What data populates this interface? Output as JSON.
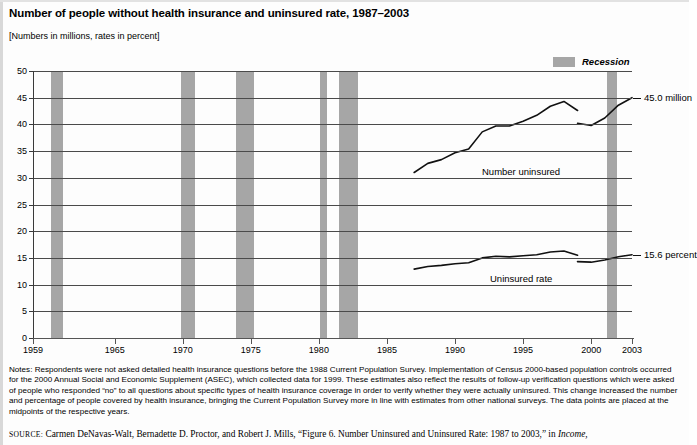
{
  "header": {
    "title": "Number of people without health insurance and uninsured rate, 1987–2003",
    "subtitle": "[Numbers in millions, rates in percent]"
  },
  "legend": {
    "recession_label": "Recession",
    "recession_color": "#a6a6a6"
  },
  "notes": {
    "text": "Notes: Respondents were not asked detailed health insurance questions before the 1988 Current Population Survey. Implementation of Census 2000-based population controls occurred for the 2000 Annual Social and Economic Supplement (ASEC), which collected data for 1999. These estimates also reflect the results of follow-up verification questions which were asked of people who responded “no” to all questions about specific types of health insurance coverage in order to verify whether they were actually uninsured. This change increased the number and percentage of people covered by health insurance, bringing the Current Population Survey more in line with estimates from other national surveys. The data points are placed at the midpoints of the respective years."
  },
  "source": {
    "prefix": "SOURCE:",
    "body": "Carmen DeNavas-Walt, Bernadette D. Proctor, and Robert J. Mills, “Figure 6. Number Uninsured and Uninsured Rate: 1987 to 2003,” in ",
    "italic_tail": "Income,"
  },
  "chart_data": {
    "type": "line",
    "title": "Number of people without health insurance and uninsured rate, 1987–2003",
    "subtitle": "[Numbers in millions, rates in percent]",
    "xlabel": "",
    "ylabel": "",
    "xlim": [
      1959,
      2003
    ],
    "ylim": [
      0,
      50
    ],
    "ytick_values": [
      0,
      5,
      10,
      15,
      20,
      25,
      30,
      35,
      40,
      45,
      50
    ],
    "ytick_labels": [
      "0",
      "5",
      "10",
      "15",
      "20",
      "25",
      "30",
      "35",
      "40",
      "45",
      "50"
    ],
    "xtick_values": [
      1959,
      1965,
      1970,
      1975,
      1980,
      1985,
      1990,
      1995,
      2000,
      2003
    ],
    "xtick_labels": [
      "1959",
      "1965",
      "1970",
      "1975",
      "1980",
      "1985",
      "1990",
      "1995",
      "2000",
      "2003"
    ],
    "grid": "horizontal",
    "legend_position": "top-right",
    "series": [
      {
        "name": "Number uninsured",
        "unit": "millions",
        "annotation": "Number uninsured",
        "end_label": "45.0 million",
        "end_value": 45.0,
        "x": [
          1987,
          1988,
          1989,
          1990,
          1991,
          1992,
          1993,
          1994,
          1995,
          1996,
          1997,
          1998,
          1999
        ],
        "values": [
          31.0,
          32.7,
          33.4,
          34.7,
          35.4,
          38.6,
          39.7,
          39.7,
          40.6,
          41.7,
          43.4,
          44.3,
          42.6
        ]
      },
      {
        "name": "Number uninsured (revised methodology)",
        "unit": "millions",
        "x": [
          1999,
          2000,
          2001,
          2002,
          2003
        ],
        "values": [
          40.2,
          39.8,
          41.2,
          43.6,
          45.0
        ]
      },
      {
        "name": "Uninsured rate",
        "unit": "percent",
        "annotation": "Uninsured rate",
        "end_label": "15.6 percent",
        "end_value": 15.6,
        "x": [
          1987,
          1988,
          1989,
          1990,
          1991,
          1992,
          1993,
          1994,
          1995,
          1996,
          1997,
          1998,
          1999
        ],
        "values": [
          12.9,
          13.4,
          13.6,
          13.9,
          14.1,
          15.0,
          15.3,
          15.2,
          15.4,
          15.6,
          16.1,
          16.3,
          15.5
        ]
      },
      {
        "name": "Uninsured rate (revised methodology)",
        "unit": "percent",
        "x": [
          1999,
          2000,
          2001,
          2002,
          2003
        ],
        "values": [
          14.3,
          14.2,
          14.6,
          15.2,
          15.6
        ]
      }
    ],
    "recessions": [
      {
        "start": 1960.3,
        "end": 1961.2
      },
      {
        "start": 1969.9,
        "end": 1970.9
      },
      {
        "start": 1973.9,
        "end": 1975.2
      },
      {
        "start": 1980.1,
        "end": 1980.6
      },
      {
        "start": 1981.5,
        "end": 1982.9
      },
      {
        "start": 2001.2,
        "end": 2001.9
      }
    ]
  }
}
